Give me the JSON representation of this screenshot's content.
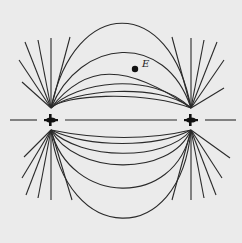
{
  "diagram": {
    "type": "electric-field-lines",
    "charges": [
      {
        "id": "left",
        "symbol": "+",
        "x": 51,
        "y": 120
      },
      {
        "id": "right",
        "symbol": "+",
        "x": 191,
        "y": 120
      }
    ],
    "point": {
      "label": "E",
      "x": 135,
      "y": 69
    },
    "colors": {
      "line": "#2a2a2a",
      "background": "#ebebeb"
    }
  }
}
